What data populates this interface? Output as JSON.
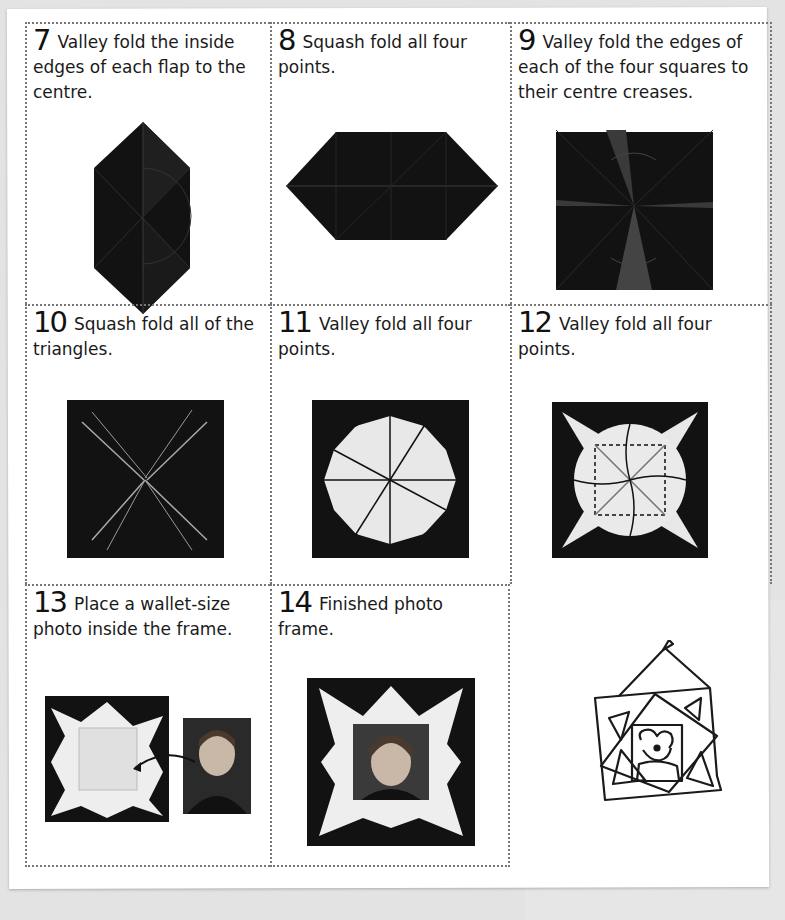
{
  "page": {
    "background_color": "#e3e3e3",
    "paper_color": "#ffffff",
    "paper_fold_color": "#121212",
    "paper_light_color": "#ececec"
  },
  "steps": [
    {
      "number": "7",
      "text": "Valley fold the inside edges of each flap to the centre.",
      "illustration": "elongated-hexagon-folded-paper"
    },
    {
      "number": "8",
      "text": "Squash fold all four points.",
      "illustration": "horizontal-hexagon-folded-paper"
    },
    {
      "number": "9",
      "text": "Valley fold the edges of each of the four squares to their centre creases.",
      "illustration": "square-with-radiating-creases"
    },
    {
      "number": "10",
      "text": "Squash fold all of the triangles.",
      "illustration": "square-with-x-creases"
    },
    {
      "number": "11",
      "text": "Valley fold all four points.",
      "illustration": "square-with-light-circular-center"
    },
    {
      "number": "12",
      "text": "Valley fold all four points.",
      "illustration": "star-with-dashed-square-and-arrows"
    },
    {
      "number": "13",
      "text": "Place a wallet-size photo inside the frame.",
      "illustration": "frame-and-portrait-photo-with-arrow"
    },
    {
      "number": "14",
      "text": "Finished photo frame.",
      "illustration": "finished-frame-with-portrait"
    }
  ],
  "sketch": {
    "description": "hand-drawn hanging picture frame with dog portrait",
    "icon": "hanging-frame-sketch-icon"
  }
}
